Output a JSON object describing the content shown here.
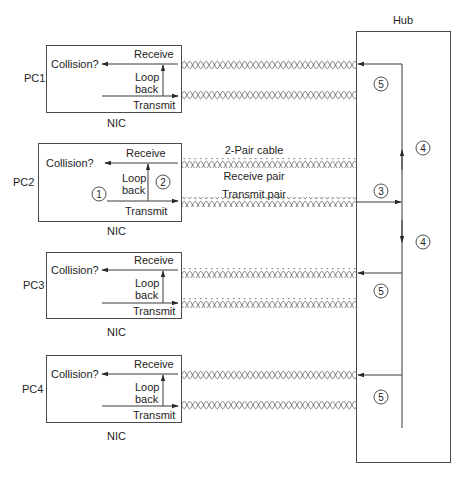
{
  "hub": {
    "label": "Hub"
  },
  "cable": {
    "title": "2-Pair cable",
    "receive_pair": "Receive pair",
    "transmit_pair": "Transmit pair"
  },
  "pcs": [
    {
      "name": "PC1",
      "nic": "NIC",
      "collision": "Collision?",
      "receive": "Receive",
      "loop1": "Loop",
      "loop2": "back",
      "transmit": "Transmit"
    },
    {
      "name": "PC2",
      "nic": "NIC",
      "collision": "Collision?",
      "receive": "Receive",
      "loop1": "Loop",
      "loop2": "back",
      "transmit": "Transmit"
    },
    {
      "name": "PC3",
      "nic": "NIC",
      "collision": "Collision?",
      "receive": "Receive",
      "loop1": "Loop",
      "loop2": "back",
      "transmit": "Transmit"
    },
    {
      "name": "PC4",
      "nic": "NIC",
      "collision": "Collision?",
      "receive": "Receive",
      "loop1": "Loop",
      "loop2": "back",
      "transmit": "Transmit"
    }
  ],
  "steps": {
    "s1": "1",
    "s2": "2",
    "s3": "3",
    "s4a": "4",
    "s4b": "4",
    "s5a": "5",
    "s5b": "5",
    "s5c": "5"
  },
  "colors": {
    "line": "#3a3a3a",
    "twist": "#6a6a6a",
    "background": "#ffffff"
  }
}
